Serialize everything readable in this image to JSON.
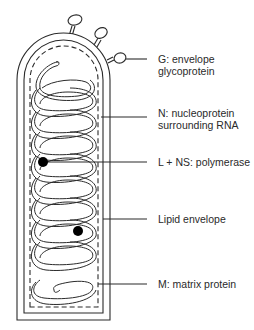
{
  "diagram": {
    "colors": {
      "stroke": "#2a2a2a",
      "background": "#ffffff",
      "fill_dot": "#000000"
    },
    "labels": [
      {
        "id": "g",
        "line1": "G: envelope",
        "line2": "glycoprotein",
        "top": 53
      },
      {
        "id": "n",
        "line1": "N: nucleoprotein",
        "line2": "surrounding RNA",
        "top": 107
      },
      {
        "id": "l",
        "line1": "L + NS: polymerase",
        "line2": "",
        "top": 156
      },
      {
        "id": "lipid",
        "line1": "Lipid envelope",
        "line2": "",
        "top": 213
      },
      {
        "id": "m",
        "line1": "M: matrix protein",
        "line2": "",
        "top": 278
      }
    ]
  }
}
